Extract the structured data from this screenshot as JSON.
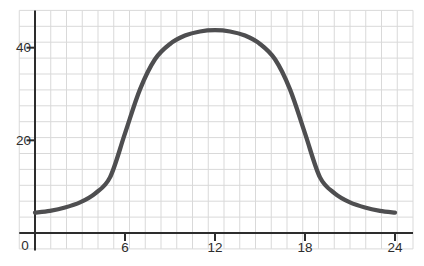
{
  "chart_data": {
    "type": "line",
    "title": "",
    "xlabel": "",
    "ylabel": "",
    "x": [
      0,
      1,
      2,
      3,
      4,
      5,
      6,
      7,
      8,
      9,
      10,
      11,
      12,
      13,
      14,
      15,
      16,
      17,
      18,
      19,
      20,
      21,
      22,
      23,
      24
    ],
    "y": [
      4.4,
      4.8,
      5.5,
      6.6,
      8.5,
      12.0,
      21.5,
      31.0,
      37.5,
      40.8,
      42.6,
      43.5,
      43.8,
      43.5,
      42.6,
      40.8,
      37.5,
      31.0,
      21.5,
      12.0,
      8.5,
      6.6,
      5.5,
      4.8,
      4.4
    ],
    "x_ticks": [
      6,
      12,
      18,
      24
    ],
    "x_tick_labels": [
      "6",
      "12",
      "18",
      "24"
    ],
    "y_ticks": [
      20,
      40
    ],
    "y_tick_labels": [
      "20",
      "40"
    ],
    "origin_label": "0",
    "xlim": [
      0,
      24
    ],
    "ylim": [
      0,
      48
    ],
    "grid": true,
    "legend": false,
    "colors": {
      "line": "#4e4e50",
      "axis": "#2d2d2d",
      "tick_label": "#2d2d2d",
      "grid": "#d9d9d9",
      "background": "#ffffff"
    }
  }
}
